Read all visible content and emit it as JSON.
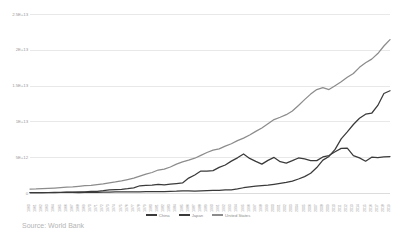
{
  "chart_data": {
    "type": "line",
    "title": "",
    "xlabel": "",
    "ylabel": "",
    "ylim": [
      0,
      25000000000000
    ],
    "xlim": [
      1960,
      2019
    ],
    "grid": true,
    "legend_position": "bottom",
    "ytick_labels": [
      "2.5E+13",
      "2E+13",
      "1.5E+13",
      "1E+13",
      "5E+12",
      "0"
    ],
    "ytick_values": [
      25000000000000,
      20000000000000,
      15000000000000,
      10000000000000,
      5000000000000,
      0
    ],
    "x": [
      1960,
      1961,
      1962,
      1963,
      1964,
      1965,
      1966,
      1967,
      1968,
      1969,
      1970,
      1971,
      1972,
      1973,
      1974,
      1975,
      1976,
      1977,
      1978,
      1979,
      1980,
      1981,
      1982,
      1983,
      1984,
      1985,
      1986,
      1987,
      1988,
      1989,
      1990,
      1991,
      1992,
      1993,
      1994,
      1995,
      1996,
      1997,
      1998,
      1999,
      2000,
      2001,
      2002,
      2003,
      2004,
      2005,
      2006,
      2007,
      2008,
      2009,
      2010,
      2011,
      2012,
      2013,
      2014,
      2015,
      2016,
      2017,
      2018,
      2019
    ],
    "series": [
      {
        "name": "China",
        "color": "#3a3a3a",
        "values": [
          59700000000.0,
          50000000000.0,
          47100000000.0,
          50700000000.0,
          59700000000.0,
          70400000000.0,
          76600000000.0,
          72700000000.0,
          70000000000.0,
          79100000000.0,
          91500000000.0,
          98700000000.0,
          113000000000.0,
          137000000000.0,
          144000000000.0,
          162000000000.0,
          154000000000.0,
          173000000000.0,
          150000000000.0,
          178000000000.0,
          191000000000.0,
          196000000000.0,
          205000000000.0,
          230000000000.0,
          259000000000.0,
          310000000000.0,
          301000000000.0,
          273000000000.0,
          312000000000.0,
          347000000000.0,
          361000000000.0,
          383000000000.0,
          427000000000.0,
          445000000000.0,
          564000000000.0,
          735000000000.0,
          864000000000.0,
          962000000000.0,
          1030000000000.0,
          1090000000000.0,
          1210000000000.0,
          1340000000000.0,
          1470000000000.0,
          1660000000000.0,
          1960000000000.0,
          2290000000000.0,
          2750000000000.0,
          3550000000000.0,
          4590000000000.0,
          5110000000000.0,
          6090000000000.0,
          7550000000000.0,
          8530000000000.0,
          9570000000000.0,
          10440000000000.0,
          11010000000000.0,
          11140000000000.0,
          12230000000000.0,
          13890000000000.0,
          14280000000000.0
        ]
      },
      {
        "name": "Japan",
        "color": "#3a3a3a",
        "values": [
          44300000000.0,
          53500000000.0,
          60700000000.0,
          69500000000.0,
          81700000000.0,
          90900000000.0,
          106000000000.0,
          124000000000.0,
          146000000000.0,
          173000000000.0,
          213000000000.0,
          241000000000.0,
          320000000000.0,
          433000000000.0,
          481000000000.0,
          522000000000.0,
          595000000000.0,
          722000000000.0,
          1010000000000.0,
          1060000000000.0,
          1110000000000.0,
          1220000000000.0,
          1130000000000.0,
          1240000000000.0,
          1320000000000.0,
          1400000000000.0,
          2080000000000.0,
          2520000000000.0,
          3070000000000.0,
          3050000000000.0,
          3130000000000.0,
          3580000000000.0,
          3910000000000.0,
          4450000000000.0,
          4910000000000.0,
          5450000000000.0,
          4830000000000.0,
          4410000000000.0,
          4030000000000.0,
          4560000000000.0,
          4970000000000.0,
          4370000000000.0,
          4180000000000.0,
          4520000000000.0,
          4890000000000.0,
          4760000000000.0,
          4530000000000.0,
          4520000000000.0,
          5040000000000.0,
          5230000000000.0,
          5760000000000.0,
          6230000000000.0,
          6270000000000.0,
          5210000000000.0,
          4900000000000.0,
          4440000000000.0,
          5000000000000.0,
          4930000000000.0,
          5040000000000.0,
          5080000000000.0
        ]
      },
      {
        "name": "United States",
        "color": "#8c8c8c",
        "values": [
          543000000000.0,
          563000000000.0,
          605000000000.0,
          639000000000.0,
          686000000000.0,
          744000000000.0,
          815000000000.0,
          862000000000.0,
          942000000000.0,
          1020000000000.0,
          1070000000000.0,
          1170000000000.0,
          1280000000000.0,
          1430000000000.0,
          1550000000000.0,
          1690000000000.0,
          1880000000000.0,
          2090000000000.0,
          2360000000000.0,
          2630000000000.0,
          2860000000000.0,
          3210000000000.0,
          3340000000000.0,
          3630000000000.0,
          4040000000000.0,
          4340000000000.0,
          4580000000000.0,
          4860000000000.0,
          5250000000000.0,
          5660000000000.0,
          5980000000000.0,
          6170000000000.0,
          6540000000000.0,
          6880000000000.0,
          7310000000000.0,
          7660000000000.0,
          8100000000000.0,
          8610000000000.0,
          9090000000000.0,
          9660000000000.0,
          10250000000000.0,
          10580000000000.0,
          10940000000000.0,
          11460000000000.0,
          12220000000000.0,
          13040000000000.0,
          13810000000000.0,
          14450000000000.0,
          14710000000000.0,
          14450000000000.0,
          14990000000000.0,
          15540000000000.0,
          16160000000000.0,
          16690000000000.0,
          17550000000000.0,
          18200000000000.0,
          18700000000000.0,
          19480000000000.0,
          20530000000000.0,
          21430000000000.0
        ]
      }
    ]
  },
  "legend": {
    "items": [
      {
        "label": "China"
      },
      {
        "label": "Japan"
      },
      {
        "label": "United States"
      }
    ]
  },
  "footer": {
    "source_note": "Source: World Bank"
  }
}
